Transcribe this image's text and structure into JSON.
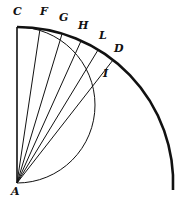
{
  "diagram": {
    "colors": {
      "stroke": "#111111",
      "background": "#ffffff"
    },
    "center": {
      "x": 17,
      "y": 183
    },
    "outer_radius": 156,
    "inner_circle": {
      "cx": 17,
      "cy": 105,
      "r": 78
    },
    "radii_to": [
      {
        "name": "F",
        "x": 40,
        "y": 29
      },
      {
        "name": "G",
        "x": 62,
        "y": 34
      },
      {
        "name": "H",
        "x": 81,
        "y": 41
      },
      {
        "name": "L",
        "x": 98,
        "y": 50
      },
      {
        "name": "D",
        "x": 113,
        "y": 60
      }
    ],
    "labels": [
      {
        "text": "C",
        "x": 13,
        "y": 13
      },
      {
        "text": "F",
        "x": 40,
        "y": 13
      },
      {
        "text": "G",
        "x": 59,
        "y": 19
      },
      {
        "text": "H",
        "x": 79,
        "y": 27
      },
      {
        "text": "L",
        "x": 99,
        "y": 36
      },
      {
        "text": "D",
        "x": 114,
        "y": 49
      },
      {
        "text": "I",
        "x": 103,
        "y": 73
      },
      {
        "text": "A",
        "x": 12,
        "y": 190
      }
    ]
  }
}
